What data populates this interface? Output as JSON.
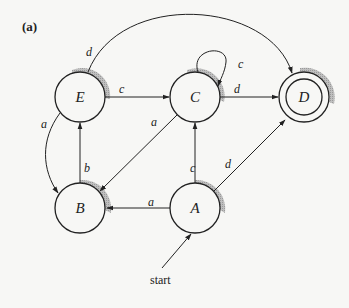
{
  "figure_label": "(a)",
  "start_label": "start",
  "nodes": [
    {
      "id": "E",
      "label": "E",
      "x": 80,
      "y": 97,
      "accepting": false
    },
    {
      "id": "C",
      "label": "C",
      "x": 195,
      "y": 97,
      "accepting": false
    },
    {
      "id": "D",
      "label": "D",
      "x": 304,
      "y": 97,
      "accepting": true
    },
    {
      "id": "B",
      "label": "B",
      "x": 80,
      "y": 208,
      "accepting": false
    },
    {
      "id": "A",
      "label": "A",
      "x": 195,
      "y": 208,
      "accepting": false
    }
  ],
  "edges": [
    {
      "from": "E",
      "to": "D",
      "label": "d"
    },
    {
      "from": "E",
      "to": "C",
      "label": "c"
    },
    {
      "from": "E",
      "to": "B",
      "label": "a"
    },
    {
      "from": "C",
      "to": "C",
      "label": "c"
    },
    {
      "from": "C",
      "to": "D",
      "label": "d"
    },
    {
      "from": "C",
      "to": "B",
      "label": "a"
    },
    {
      "from": "B",
      "to": "E",
      "label": "b"
    },
    {
      "from": "A",
      "to": "B",
      "label": "a"
    },
    {
      "from": "A",
      "to": "C",
      "label": "c"
    },
    {
      "from": "A",
      "to": "D",
      "label": "d"
    },
    {
      "from": "start",
      "to": "A",
      "label": ""
    }
  ],
  "edge_labels": {
    "e_d": "d",
    "e_c": "c",
    "e_b": "a",
    "c_c": "c",
    "c_d": "d",
    "c_b": "a",
    "b_e": "b",
    "a_b": "a",
    "a_c": "c",
    "a_d": "d"
  }
}
